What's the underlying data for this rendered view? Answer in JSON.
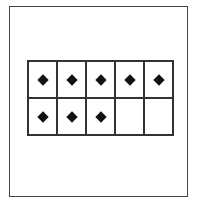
{
  "ten_frame": {
    "rows": 2,
    "columns": 5,
    "filled_count": 8,
    "cells": [
      {
        "filled": true
      },
      {
        "filled": true
      },
      {
        "filled": true
      },
      {
        "filled": true
      },
      {
        "filled": true
      },
      {
        "filled": true
      },
      {
        "filled": true
      },
      {
        "filled": true
      },
      {
        "filled": false
      },
      {
        "filled": false
      }
    ],
    "marker_shape": "diamond",
    "marker_color": "#111111",
    "line_color": "#333333"
  }
}
